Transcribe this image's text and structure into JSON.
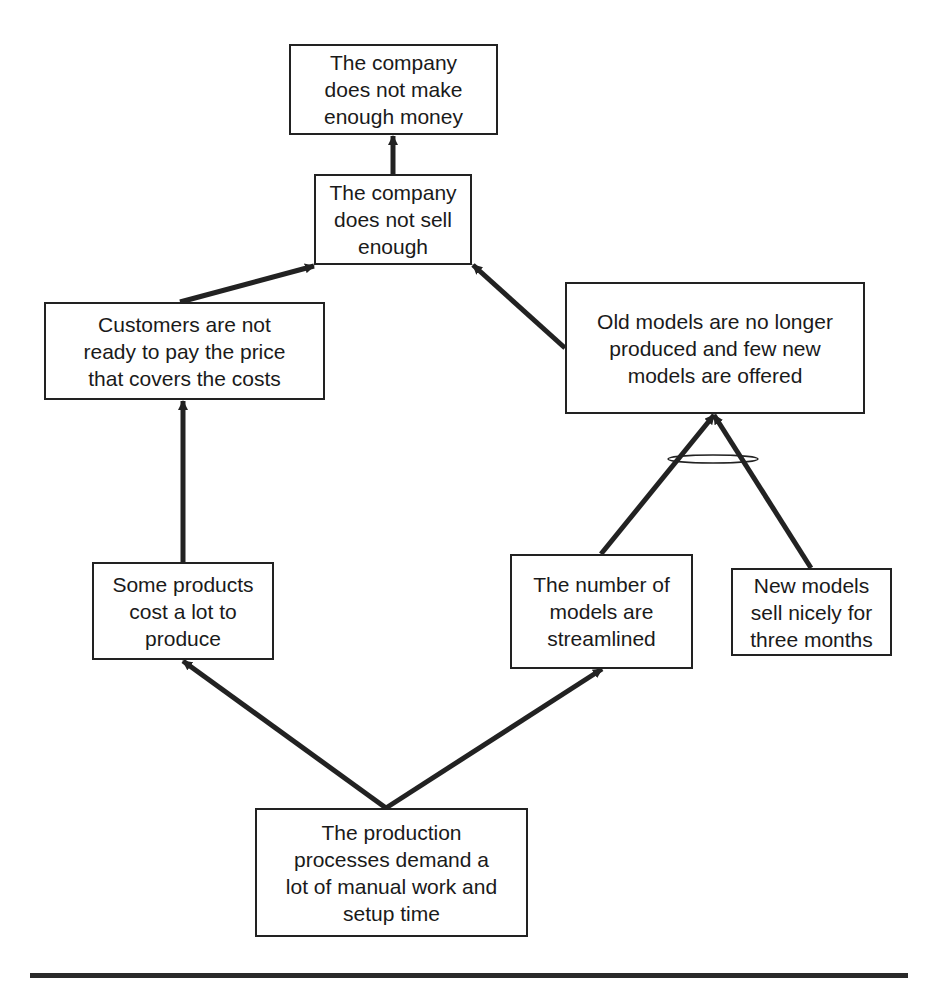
{
  "diagram": {
    "type": "current-reality-tree",
    "nodes": [
      {
        "id": "n1",
        "text": "The company\ndoes not make\nenough money",
        "box": [
          289,
          44,
          209,
          91
        ]
      },
      {
        "id": "n2",
        "text": "The company\ndoes not sell\nenough",
        "box": [
          314,
          174,
          158,
          91
        ]
      },
      {
        "id": "n3",
        "text": "Customers are not\nready to pay the price\nthat covers the costs",
        "box": [
          44,
          302,
          281,
          98
        ]
      },
      {
        "id": "n4",
        "text": "Old models are no longer\nproduced and few new\nmodels are offered",
        "box": [
          565,
          282,
          300,
          132
        ]
      },
      {
        "id": "n5",
        "text": "Some products\ncost a lot to\nproduce",
        "box": [
          92,
          562,
          182,
          98
        ]
      },
      {
        "id": "n6",
        "text": "The number of\nmodels are\nstreamlined",
        "box": [
          510,
          554,
          183,
          115
        ]
      },
      {
        "id": "n7",
        "text": "New models\nsell nicely for\nthree months",
        "box": [
          731,
          568,
          161,
          88
        ]
      },
      {
        "id": "n8",
        "text": "The production\nprocesses demand a\nlot of manual work and\nsetup time",
        "box": [
          255,
          808,
          273,
          129
        ]
      }
    ],
    "edges": [
      {
        "from": "n2",
        "to": "n1",
        "points": [
          393,
          174,
          393,
          136
        ]
      },
      {
        "from": "n3",
        "to": "n2",
        "points": [
          180,
          302,
          314,
          266
        ]
      },
      {
        "from": "n4",
        "to": "n2",
        "points": [
          565,
          348,
          473,
          265
        ]
      },
      {
        "from": "n5",
        "to": "n3",
        "points": [
          183,
          562,
          183,
          401
        ]
      },
      {
        "from": "n6",
        "to": "n4",
        "points": [
          601,
          554,
          714,
          415
        ]
      },
      {
        "from": "n7",
        "to": "n4",
        "points": [
          811,
          568,
          714,
          415
        ]
      },
      {
        "from": "n8",
        "to": "n5",
        "points": [
          386,
          808,
          183,
          661
        ]
      },
      {
        "from": "n8",
        "to": "n6",
        "points": [
          386,
          808,
          602,
          669
        ]
      }
    ],
    "and_connector": {
      "joins": [
        "n6",
        "n7"
      ],
      "target": "n4",
      "ellipse": [
        713,
        459,
        45,
        4
      ]
    },
    "colors": {
      "stroke": "#222222",
      "background": "#ffffff"
    }
  }
}
